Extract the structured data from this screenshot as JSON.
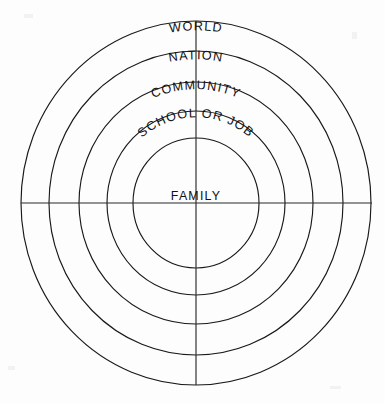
{
  "diagram": {
    "type": "concentric-circles",
    "background_color": "#fdfdfd",
    "line_color": "#191919",
    "text_color": "#111111",
    "center": {
      "x": 196,
      "y": 203
    },
    "axes": {
      "vertical": {
        "x": 196,
        "y_top": 21,
        "y_bottom": 385
      },
      "horizontal": {
        "y": 203,
        "x_left": 21,
        "x_right": 372
      }
    },
    "rings": [
      {
        "index": 0,
        "label": "WORLD",
        "radius_x": 175,
        "radius_y": 182,
        "label_radius": 166,
        "label_arched": true,
        "arc_sweep": 34
      },
      {
        "index": 1,
        "label": "NATION",
        "radius_x": 147,
        "radius_y": 152,
        "label_radius": 139,
        "label_arched": true,
        "arc_sweep": 40
      },
      {
        "index": 2,
        "label": "COMMUNITY",
        "radius_x": 117,
        "radius_y": 121,
        "label_radius": 110,
        "label_arched": true,
        "arc_sweep": 74
      },
      {
        "index": 3,
        "label": "SCHOOL OR JOB",
        "radius_x": 89,
        "radius_y": 92,
        "label_radius": 83,
        "label_arched": true,
        "arc_sweep": 118
      },
      {
        "index": 4,
        "label": "FAMILY",
        "radius_x": 63,
        "radius_y": 65,
        "label_radius": 0,
        "label_arched": false,
        "arc_sweep": 0
      }
    ],
    "center_label": {
      "text": "FAMILY",
      "x": 196,
      "y": 200
    }
  },
  "chart_data": {
    "type": "diagram",
    "categories": [
      "FAMILY",
      "SCHOOL OR JOB",
      "COMMUNITY",
      "NATION",
      "WORLD"
    ],
    "values": [
      63,
      89,
      117,
      147,
      175
    ],
    "xlabel": "",
    "ylabel": "radius (px)"
  }
}
